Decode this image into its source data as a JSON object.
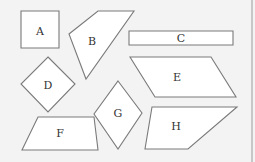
{
  "diagram": {
    "shapes": [
      {
        "id": "A",
        "label": "A",
        "type": "square",
        "points": "21,11 59,11 59,48 21,48",
        "label_pos": [
          40,
          32
        ]
      },
      {
        "id": "B",
        "label": "B",
        "type": "quadrilateral",
        "points": "69,34 98,11 134,11 86,79",
        "label_pos": [
          92,
          42
        ]
      },
      {
        "id": "C",
        "label": "C",
        "type": "rectangle",
        "points": "129,31 233,31 233,45 129,45",
        "label_pos": [
          181,
          39
        ]
      },
      {
        "id": "D",
        "label": "D",
        "type": "rhombus",
        "points": "48,57 75,84 48,112 21,84",
        "label_pos": [
          48,
          86
        ]
      },
      {
        "id": "E",
        "label": "E",
        "type": "parallelogram",
        "points": "130,57 211,57 236,97 155,97",
        "label_pos": [
          177,
          78
        ]
      },
      {
        "id": "F",
        "label": "F",
        "type": "trapezoid",
        "points": "38,117 94,117 98,150 22,150",
        "label_pos": [
          60,
          134
        ]
      },
      {
        "id": "G",
        "label": "G",
        "type": "rhombus",
        "points": "118,81 142,113 118,149 94,114",
        "label_pos": [
          118,
          114
        ]
      },
      {
        "id": "H",
        "label": "H",
        "type": "quadrilateral",
        "points": "152,107 237,107 188,149 145,149",
        "label_pos": [
          176,
          127
        ]
      }
    ],
    "colors": {
      "background": "#f3f3f3",
      "shape_fill": "#ffffff",
      "shape_stroke": "#7a7a7a",
      "label": "#333333"
    }
  }
}
